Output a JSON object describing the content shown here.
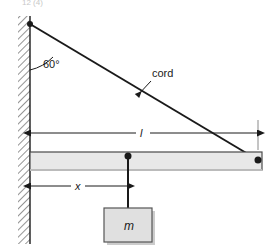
{
  "figure": {
    "name": "beam-cord-hanging-mass-statics-diagram",
    "cropped_header_text": "12  (4)",
    "colors": {
      "line": "#1a1a1a",
      "beam_fill": "#e8e8e8",
      "beam_stroke": "#4a4a4a",
      "mass_fill": "#e0e0e0",
      "mass_stroke": "#555555",
      "wall_hatch": "#7a7a7a",
      "dimension": "#1a1a1a",
      "shadow": "#cccccc",
      "background": "#ffffff"
    }
  },
  "labels": {
    "angle": "60°",
    "cord": "cord",
    "length": "l",
    "distance": "x",
    "mass": "m"
  },
  "elements": {
    "wall": "wall-hatched",
    "beam": "horizontal-beam",
    "cord": "cord-line",
    "rope": "vertical-rope",
    "mass_block": "hanging-mass-block",
    "pivot_wall": "cord-wall-anchor-point",
    "pivot_beam": "cord-beam-anchor-point",
    "hang_point": "mass-attachment-point"
  },
  "geometry": {
    "angle_from_wall_deg": 60,
    "wall_x": 30,
    "cord_top_y": 24,
    "cord_end_x": 258,
    "cord_end_y": 160,
    "beam_top_y": 152,
    "beam_bottom_y": 170,
    "dim_l_y": 133,
    "dim_x_y": 186,
    "hang_x": 128,
    "mass_box": {
      "x": 104,
      "y": 208,
      "w": 48,
      "h": 34
    }
  }
}
